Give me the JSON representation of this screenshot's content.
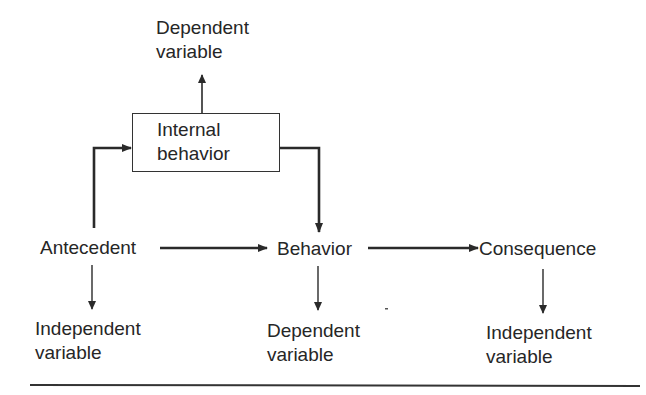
{
  "diagram": {
    "top_label": {
      "line1": "Dependent",
      "line2": "variable"
    },
    "internal_box": {
      "line1": "Internal",
      "line2": "behavior"
    },
    "nodes": {
      "antecedent": "Antecedent",
      "behavior": "Behavior",
      "consequence": "Consequence"
    },
    "bottom_labels": {
      "antecedent": {
        "line1": "Independent",
        "line2": "variable"
      },
      "behavior": {
        "line1": "Dependent",
        "line2": "variable"
      },
      "consequence": {
        "line1": "Independent",
        "line2": "variable"
      }
    },
    "edges": [
      {
        "from": "Antecedent",
        "to": "Internal behavior",
        "style": "bold elbow"
      },
      {
        "from": "Internal behavior",
        "to": "Behavior",
        "style": "bold elbow"
      },
      {
        "from": "Internal behavior",
        "to": "Dependent variable (top)"
      },
      {
        "from": "Antecedent",
        "to": "Behavior",
        "style": "bold"
      },
      {
        "from": "Behavior",
        "to": "Consequence",
        "style": "bold"
      },
      {
        "from": "Antecedent",
        "to": "Independent variable"
      },
      {
        "from": "Behavior",
        "to": "Dependent variable"
      },
      {
        "from": "Consequence",
        "to": "Independent variable"
      }
    ]
  }
}
